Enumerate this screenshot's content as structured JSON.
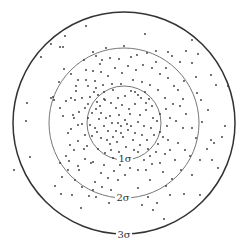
{
  "diagram": {
    "title": "",
    "center": [
      124,
      123
    ],
    "circles": [
      {
        "name": "1-sigma",
        "label": "1σ",
        "r": 37,
        "stroke": "#777",
        "width": 1,
        "label_pos": [
          125,
          162
        ]
      },
      {
        "name": "2-sigma",
        "label": "2σ",
        "r": 75,
        "stroke": "#777",
        "width": 1,
        "label_pos": [
          123,
          201
        ]
      },
      {
        "name": "3-sigma",
        "label": "3σ",
        "r": 111,
        "stroke": "#333",
        "width": 1.5,
        "label_pos": [
          124,
          238
        ]
      }
    ],
    "dot_color": "#333",
    "points": [
      [
        86,
        26
      ],
      [
        65,
        36
      ],
      [
        60,
        47
      ],
      [
        63,
        47
      ],
      [
        51,
        44
      ],
      [
        41,
        57
      ],
      [
        64,
        69
      ],
      [
        93,
        52
      ],
      [
        100,
        64
      ],
      [
        101,
        72
      ],
      [
        59,
        82
      ],
      [
        71,
        74
      ],
      [
        86,
        70
      ],
      [
        93,
        71
      ],
      [
        95,
        81
      ],
      [
        88,
        86
      ],
      [
        76,
        91
      ],
      [
        71,
        98
      ],
      [
        51,
        98
      ],
      [
        53,
        97
      ],
      [
        54,
        100
      ],
      [
        27,
        103
      ],
      [
        26,
        121
      ],
      [
        30,
        157
      ],
      [
        60,
        163
      ],
      [
        79,
        170
      ],
      [
        91,
        163
      ],
      [
        82,
        187
      ],
      [
        61,
        194
      ],
      [
        89,
        196
      ],
      [
        96,
        197
      ],
      [
        81,
        208
      ],
      [
        109,
        203
      ],
      [
        118,
        193
      ],
      [
        104,
        165
      ],
      [
        93,
        162
      ],
      [
        85,
        159
      ],
      [
        84,
        149
      ],
      [
        66,
        156
      ],
      [
        68,
        133
      ],
      [
        71,
        129
      ],
      [
        82,
        124
      ],
      [
        88,
        118
      ],
      [
        73,
        115
      ],
      [
        79,
        112
      ],
      [
        85,
        108
      ],
      [
        96,
        109
      ],
      [
        101,
        113
      ],
      [
        99,
        119
      ],
      [
        106,
        118
      ],
      [
        110,
        116
      ],
      [
        112,
        123
      ],
      [
        104,
        126
      ],
      [
        108,
        131
      ],
      [
        97,
        132
      ],
      [
        92,
        136
      ],
      [
        101,
        138
      ],
      [
        107,
        140
      ],
      [
        113,
        137
      ],
      [
        117,
        142
      ],
      [
        121,
        133
      ],
      [
        128,
        130
      ],
      [
        131,
        126
      ],
      [
        125,
        120
      ],
      [
        119,
        115
      ],
      [
        116,
        108
      ],
      [
        111,
        103
      ],
      [
        104,
        99
      ],
      [
        98,
        95
      ],
      [
        104,
        92
      ],
      [
        113,
        90
      ],
      [
        118,
        98
      ],
      [
        125,
        96
      ],
      [
        131,
        91
      ],
      [
        138,
        95
      ],
      [
        145,
        92
      ],
      [
        149,
        99
      ],
      [
        152,
        106
      ],
      [
        146,
        110
      ],
      [
        140,
        115
      ],
      [
        138,
        122
      ],
      [
        144,
        126
      ],
      [
        151,
        128
      ],
      [
        157,
        121
      ],
      [
        160,
        114
      ],
      [
        154,
        135
      ],
      [
        147,
        140
      ],
      [
        140,
        145
      ],
      [
        133,
        140
      ],
      [
        126,
        147
      ],
      [
        119,
        152
      ],
      [
        111,
        150
      ],
      [
        105,
        153
      ],
      [
        98,
        149
      ],
      [
        113,
        158
      ],
      [
        130,
        155
      ],
      [
        138,
        152
      ],
      [
        148,
        149
      ],
      [
        158,
        144
      ],
      [
        163,
        137
      ],
      [
        167,
        126
      ],
      [
        170,
        118
      ],
      [
        166,
        109
      ],
      [
        173,
        104
      ],
      [
        165,
        98
      ],
      [
        158,
        90
      ],
      [
        150,
        85
      ],
      [
        142,
        82
      ],
      [
        133,
        80
      ],
      [
        121,
        84
      ],
      [
        112,
        84
      ],
      [
        103,
        85
      ],
      [
        96,
        88
      ],
      [
        90,
        97
      ],
      [
        88,
        104
      ],
      [
        92,
        113
      ],
      [
        90,
        125
      ],
      [
        95,
        128
      ],
      [
        85,
        135
      ],
      [
        78,
        141
      ],
      [
        70,
        145
      ],
      [
        74,
        150
      ],
      [
        87,
        146
      ],
      [
        124,
        46
      ],
      [
        145,
        34
      ],
      [
        137,
        55
      ],
      [
        147,
        53
      ],
      [
        156,
        51
      ],
      [
        168,
        52
      ],
      [
        172,
        56
      ],
      [
        180,
        62
      ],
      [
        192,
        63
      ],
      [
        196,
        77
      ],
      [
        184,
        81
      ],
      [
        178,
        90
      ],
      [
        183,
        99
      ],
      [
        180,
        106
      ],
      [
        186,
        114
      ],
      [
        176,
        121
      ],
      [
        183,
        128
      ],
      [
        192,
        128
      ],
      [
        202,
        122
      ],
      [
        208,
        110
      ],
      [
        201,
        100
      ],
      [
        197,
        93
      ],
      [
        211,
        75
      ],
      [
        216,
        85
      ],
      [
        192,
        40
      ],
      [
        186,
        51
      ],
      [
        198,
        54
      ],
      [
        228,
        86
      ],
      [
        225,
        126
      ],
      [
        222,
        137
      ],
      [
        211,
        140
      ],
      [
        214,
        143
      ],
      [
        200,
        160
      ],
      [
        192,
        175
      ],
      [
        181,
        170
      ],
      [
        172,
        179
      ],
      [
        166,
        186
      ],
      [
        170,
        195
      ],
      [
        184,
        194
      ],
      [
        157,
        203
      ],
      [
        148,
        197
      ],
      [
        142,
        205
      ],
      [
        138,
        188
      ],
      [
        150,
        180
      ],
      [
        163,
        172
      ],
      [
        160,
        163
      ],
      [
        146,
        170
      ],
      [
        138,
        170
      ],
      [
        130,
        168
      ],
      [
        125,
        175
      ],
      [
        118,
        180
      ],
      [
        108,
        178
      ],
      [
        101,
        173
      ],
      [
        95,
        182
      ],
      [
        111,
        190
      ],
      [
        130,
        200
      ],
      [
        153,
        210
      ],
      [
        164,
        219
      ],
      [
        200,
        195
      ],
      [
        175,
        160
      ],
      [
        170,
        150
      ],
      [
        178,
        143
      ],
      [
        185,
        150
      ],
      [
        190,
        156
      ],
      [
        196,
        138
      ],
      [
        207,
        149
      ],
      [
        212,
        160
      ],
      [
        218,
        168
      ],
      [
        14,
        170
      ],
      [
        168,
        140
      ],
      [
        160,
        132
      ],
      [
        153,
        118
      ],
      [
        146,
        103
      ],
      [
        141,
        98
      ],
      [
        135,
        104
      ],
      [
        129,
        109
      ],
      [
        122,
        105
      ],
      [
        116,
        131
      ],
      [
        110,
        144
      ],
      [
        123,
        137
      ],
      [
        135,
        133
      ],
      [
        142,
        135
      ],
      [
        150,
        156
      ],
      [
        156,
        152
      ],
      [
        165,
        154
      ],
      [
        120,
        165
      ],
      [
        114,
        171
      ],
      [
        102,
        187
      ],
      [
        93,
        190
      ],
      [
        75,
        180
      ],
      [
        68,
        170
      ],
      [
        62,
        177
      ],
      [
        55,
        186
      ],
      [
        72,
        195
      ],
      [
        78,
        166
      ],
      [
        69,
        161
      ],
      [
        74,
        118
      ],
      [
        78,
        125
      ],
      [
        63,
        116
      ],
      [
        60,
        108
      ],
      [
        66,
        101
      ],
      [
        75,
        100
      ],
      [
        82,
        98
      ],
      [
        94,
        92
      ],
      [
        108,
        76
      ],
      [
        115,
        68
      ],
      [
        122,
        73
      ],
      [
        128,
        66
      ],
      [
        136,
        70
      ],
      [
        143,
        65
      ],
      [
        152,
        68
      ],
      [
        160,
        74
      ],
      [
        168,
        78
      ],
      [
        174,
        86
      ],
      [
        166,
        68
      ],
      [
        156,
        62
      ],
      [
        131,
        57
      ],
      [
        119,
        59
      ],
      [
        110,
        58
      ],
      [
        102,
        60
      ],
      [
        96,
        56
      ],
      [
        106,
        48
      ],
      [
        84,
        60
      ],
      [
        78,
        80
      ],
      [
        76,
        86
      ],
      [
        86,
        80
      ],
      [
        105,
        100
      ],
      [
        130,
        114
      ],
      [
        134,
        150
      ],
      [
        144,
        160
      ],
      [
        152,
        164
      ],
      [
        118,
        123
      ],
      [
        127,
        124
      ],
      [
        121,
        126
      ],
      [
        100,
        106
      ],
      [
        97,
        102
      ],
      [
        135,
        92
      ]
    ]
  }
}
